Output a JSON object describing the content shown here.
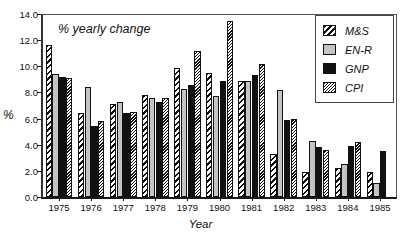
{
  "chart_data": {
    "type": "bar",
    "title": "",
    "annotation": "% yearly change",
    "xlabel": "Year",
    "ylabel": "%",
    "ylim": [
      0.0,
      14.0
    ],
    "ytick_step": 2.0,
    "yticks": [
      "0.0",
      "2.0",
      "4.0",
      "6.0",
      "8.0",
      "10.0",
      "12.0",
      "14.0"
    ],
    "grid": false,
    "legend_position": "top-right",
    "categories": [
      "1975",
      "1976",
      "1977",
      "1978",
      "1979",
      "1980",
      "1981",
      "1982",
      "1983",
      "1984",
      "1985"
    ],
    "series": [
      {
        "name": "M&S",
        "pattern": "diagonal-hatch",
        "color": "#ffffff",
        "values": [
          11.6,
          6.4,
          7.1,
          7.8,
          9.9,
          9.5,
          8.9,
          3.3,
          1.9,
          2.2,
          1.9
        ]
      },
      {
        "name": "EN-R",
        "pattern": "solid-gray",
        "color": "#c4c4c4",
        "values": [
          9.4,
          8.4,
          7.3,
          7.6,
          8.3,
          7.7,
          8.9,
          8.2,
          4.3,
          2.5,
          1.1
        ]
      },
      {
        "name": "GNP",
        "pattern": "solid-black",
        "color": "#111111",
        "values": [
          9.2,
          5.4,
          6.4,
          7.3,
          8.6,
          8.9,
          9.3,
          5.9,
          3.8,
          3.9,
          3.5
        ]
      },
      {
        "name": "CPI",
        "pattern": "fine-diagonal-hatch",
        "color": "#ffffff",
        "values": [
          9.1,
          5.8,
          6.5,
          7.6,
          11.2,
          13.5,
          10.2,
          6.0,
          3.6,
          4.2,
          null
        ]
      }
    ]
  }
}
